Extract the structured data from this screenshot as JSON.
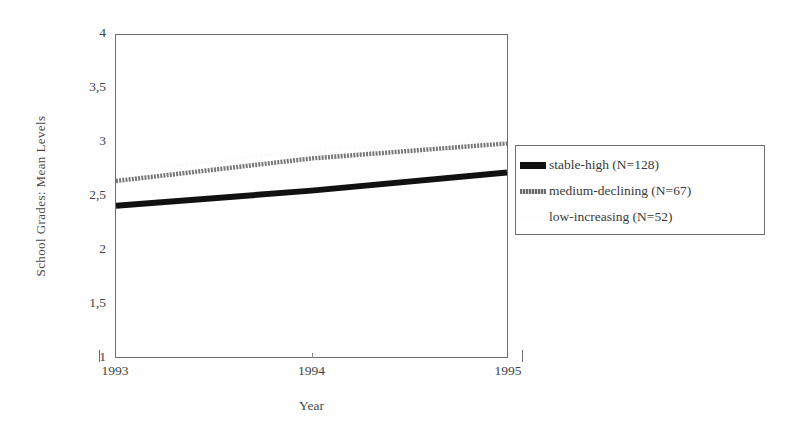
{
  "chart_data": {
    "type": "line",
    "title": "",
    "xlabel": "Year",
    "ylabel": "School Grades: Mean Levels",
    "x": [
      "1993",
      "1994",
      "1995"
    ],
    "xlim": [
      1993,
      1995
    ],
    "ylim": [
      1,
      4
    ],
    "yticks": [
      "4",
      "3,5",
      "3",
      "2,5",
      "2",
      "1,5",
      "1"
    ],
    "ytick_values": [
      4,
      3.5,
      3,
      2.5,
      2,
      1.5,
      1
    ],
    "xticks": [
      "1993",
      "1994",
      "1995"
    ],
    "grid": false,
    "legend_position": "right",
    "series": [
      {
        "name": "stable-high (N=128)",
        "style": "solid-thick-black",
        "color": "#111111",
        "values": [
          2.41,
          2.55,
          2.72
        ]
      },
      {
        "name": "medium-declining (N=67)",
        "style": "dotted-gray",
        "color": "#6b6b6b",
        "values": [
          2.64,
          2.85,
          2.99
        ]
      },
      {
        "name": "low-increasing (N=52)",
        "style": "faint-white",
        "color": "#fafafa",
        "values": [
          2.72,
          2.93,
          3.02
        ]
      }
    ]
  },
  "axes": {
    "y_title": "School Grades: Mean Levels",
    "x_title": "Year",
    "y_labels": [
      "4",
      "3,5",
      "3",
      "2,5",
      "2",
      "1,5",
      "1"
    ],
    "x_labels": [
      "1993",
      "1994",
      "1995"
    ]
  },
  "legend": {
    "entries": [
      {
        "label": "stable-high (N=128)",
        "swatch": "solid-black-line-swatch"
      },
      {
        "label": "medium-declining (N=67)",
        "swatch": "dotted-gray-line-swatch"
      },
      {
        "label": "low-increasing (N=52)",
        "swatch": "faint-white-line-swatch"
      }
    ]
  }
}
